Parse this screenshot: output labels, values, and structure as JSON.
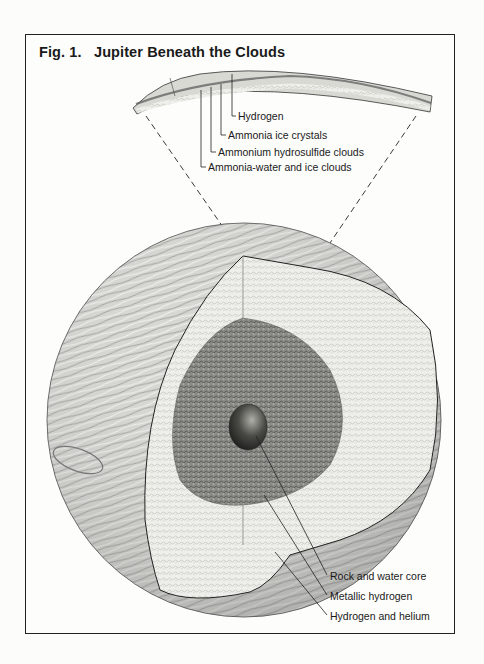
{
  "figure": {
    "title": "Fig. 1.   Jupiter Beneath the Clouds",
    "crust_labels": [
      {
        "text": "Hydrogen"
      },
      {
        "text": "Ammonia ice crystals"
      },
      {
        "text": "Ammonium hydrosulfide clouds"
      },
      {
        "text": "Ammonia-water and ice clouds"
      }
    ],
    "interior_labels": [
      {
        "text": "Rock and water core"
      },
      {
        "text": "Metallic hydrogen"
      },
      {
        "text": "Hydrogen and helium"
      }
    ],
    "colors": {
      "frame": "#222222",
      "background": "#fdfdfb",
      "surface": "#c8c8c4",
      "outer_layer": "#ecece8",
      "metallic_layer": "#7a7a76",
      "core": "#3a3a38"
    }
  }
}
